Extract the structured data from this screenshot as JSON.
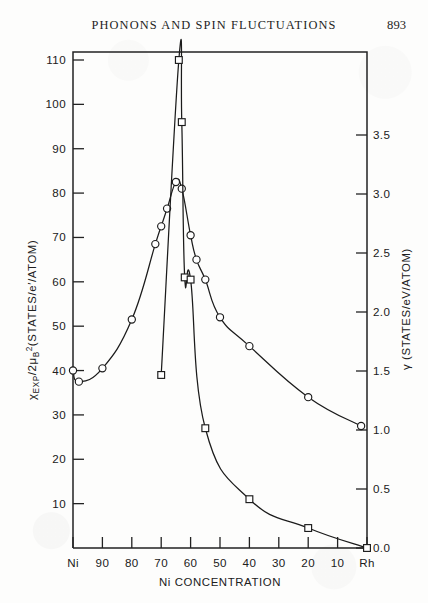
{
  "header": {
    "running_head": "PHONONS AND SPIN FLUCTUATIONS",
    "page_number": "893"
  },
  "chart_data": {
    "type": "line",
    "title": "",
    "xlabel": "Ni CONCENTRATION",
    "ylabel_left": "χEXP/2μB2 (STATES/e·/ATOM)",
    "ylabel_right": "γ (STATES/eV/ATOM)",
    "x_axis": {
      "tick_labels": [
        "Ni",
        "90",
        "80",
        "70",
        "60",
        "50",
        "40",
        "30",
        "20",
        "10",
        "Rh"
      ],
      "tick_values": [
        100,
        90,
        80,
        70,
        60,
        50,
        40,
        30,
        20,
        10,
        0
      ],
      "direction": "decreasing",
      "xlim": [
        100,
        0
      ]
    },
    "y_axis_left": {
      "tick_labels": [
        "110",
        "100",
        "90",
        "80",
        "70",
        "60",
        "50",
        "40",
        "30",
        "20",
        "10"
      ],
      "tick_values": [
        110,
        100,
        90,
        80,
        70,
        60,
        50,
        40,
        30,
        20,
        10
      ],
      "ylim": [
        0,
        115
      ]
    },
    "y_axis_right": {
      "tick_labels": [
        "3.5",
        "3.0",
        "2.5",
        "2.0",
        "1.5",
        "1.0",
        "0.5",
        "0.0"
      ],
      "tick_values": [
        3.5,
        3.0,
        2.5,
        2.0,
        1.5,
        1.0,
        0.5,
        0.0
      ],
      "ylim": [
        0.0,
        3.9
      ]
    },
    "grid": false,
    "legend": "none",
    "series": [
      {
        "name": "χEXP/2μB2",
        "marker": "circle",
        "axis": "left",
        "points": [
          {
            "x": 100,
            "y": 40
          },
          {
            "x": 98,
            "y": 37.5
          },
          {
            "x": 90,
            "y": 40.5
          },
          {
            "x": 80,
            "y": 51.5
          },
          {
            "x": 72,
            "y": 68.5
          },
          {
            "x": 70,
            "y": 72.5
          },
          {
            "x": 68,
            "y": 76.5
          },
          {
            "x": 65,
            "y": 82.5
          },
          {
            "x": 63,
            "y": 81
          },
          {
            "x": 60,
            "y": 70.5
          },
          {
            "x": 58,
            "y": 65
          },
          {
            "x": 55,
            "y": 60.5
          },
          {
            "x": 50,
            "y": 52
          },
          {
            "x": 40,
            "y": 45.5
          },
          {
            "x": 20,
            "y": 34
          },
          {
            "x": 2,
            "y": 27.5
          }
        ]
      },
      {
        "name": "γ",
        "marker": "square",
        "axis": "left",
        "points": [
          {
            "x": 70,
            "y": 39
          },
          {
            "x": 64,
            "y": 110
          },
          {
            "x": 63,
            "y": 96
          },
          {
            "x": 62,
            "y": 61
          },
          {
            "x": 60,
            "y": 60.5
          },
          {
            "x": 55,
            "y": 27
          },
          {
            "x": 40,
            "y": 11
          },
          {
            "x": 20,
            "y": 4.5
          },
          {
            "x": 0,
            "y": 0
          }
        ]
      }
    ]
  }
}
